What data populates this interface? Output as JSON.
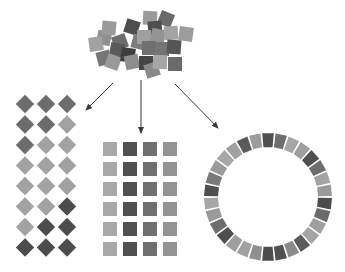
{
  "diagram": {
    "title": "",
    "palette": {
      "darkest": "#4a4a4a",
      "dark": "#5e5e5e",
      "mid_dark": "#6f6f6f",
      "mid": "#878787",
      "light_mid": "#999999",
      "light": "#a9a9a9",
      "arrow": "#3a3a3a",
      "background": "#ffffff"
    },
    "source_cluster": {
      "label": "scattered-squares",
      "squares": [
        {
          "x": 104,
          "y": 38,
          "s": 14,
          "r": 12,
          "c": "#8f8f8f"
        },
        {
          "x": 96,
          "y": 44,
          "s": 14,
          "r": -8,
          "c": "#a2a2a2"
        },
        {
          "x": 109,
          "y": 28,
          "s": 14,
          "r": 5,
          "c": "#9a9a9a"
        },
        {
          "x": 132,
          "y": 27,
          "s": 14,
          "r": 18,
          "c": "#4e4e4e"
        },
        {
          "x": 120,
          "y": 42,
          "s": 14,
          "r": -20,
          "c": "#6d6d6d"
        },
        {
          "x": 117,
          "y": 50,
          "s": 14,
          "r": 10,
          "c": "#5a5a5a"
        },
        {
          "x": 104,
          "y": 58,
          "s": 14,
          "r": -15,
          "c": "#767676"
        },
        {
          "x": 113,
          "y": 62,
          "s": 14,
          "r": 20,
          "c": "#999999"
        },
        {
          "x": 128,
          "y": 55,
          "s": 14,
          "r": 8,
          "c": "#3e3e3e"
        },
        {
          "x": 132,
          "y": 62,
          "s": 14,
          "r": -12,
          "c": "#8e8e8e"
        },
        {
          "x": 139,
          "y": 42,
          "s": 14,
          "r": 15,
          "c": "#7c7c7c"
        },
        {
          "x": 150,
          "y": 18,
          "s": 14,
          "r": 3,
          "c": "#9b9b9b"
        },
        {
          "x": 166,
          "y": 19,
          "s": 14,
          "r": 22,
          "c": "#6a6a6a"
        },
        {
          "x": 155,
          "y": 28,
          "s": 14,
          "r": -5,
          "c": "#4f4f4f"
        },
        {
          "x": 144,
          "y": 37,
          "s": 14,
          "r": 0,
          "c": "#a0a0a0"
        },
        {
          "x": 158,
          "y": 36,
          "s": 14,
          "r": 12,
          "c": "#939393"
        },
        {
          "x": 171,
          "y": 33,
          "s": 14,
          "r": -3,
          "c": "#a4a4a4"
        },
        {
          "x": 186,
          "y": 34,
          "s": 14,
          "r": 8,
          "c": "#9c9c9c"
        },
        {
          "x": 149,
          "y": 48,
          "s": 14,
          "r": 0,
          "c": "#707070"
        },
        {
          "x": 162,
          "y": 49,
          "s": 14,
          "r": 0,
          "c": "#757575"
        },
        {
          "x": 174,
          "y": 47,
          "s": 14,
          "r": 4,
          "c": "#555555"
        },
        {
          "x": 146,
          "y": 63,
          "s": 14,
          "r": 0,
          "c": "#454545"
        },
        {
          "x": 152,
          "y": 70,
          "s": 14,
          "r": -18,
          "c": "#8a8a8a"
        },
        {
          "x": 160,
          "y": 62,
          "s": 14,
          "r": 2,
          "c": "#a6a6a6"
        },
        {
          "x": 175,
          "y": 64,
          "s": 14,
          "r": 0,
          "c": "#6a6a6a"
        }
      ]
    },
    "arrows": [
      {
        "name": "arrow-to-diamond-lattice",
        "x1": 113,
        "y1": 83,
        "x2": 86,
        "y2": 110
      },
      {
        "name": "arrow-to-square-grid",
        "x1": 141,
        "y1": 80,
        "x2": 141,
        "y2": 133
      },
      {
        "name": "arrow-to-ring",
        "x1": 175,
        "y1": 84,
        "x2": 218,
        "y2": 128
      }
    ],
    "diamond_lattice": {
      "label": "diamond-lattice",
      "columns": 3,
      "rows": 8,
      "origin_x": 25,
      "origin_y": 104,
      "step_x": 21,
      "step_y": 20.5,
      "size": 13,
      "colors": [
        [
          "#6c6c6c",
          "#6c6c6c",
          "#6c6c6c"
        ],
        [
          "#6c6c6c",
          "#6c6c6c",
          "#a2a2a2"
        ],
        [
          "#6c6c6c",
          "#a2a2a2",
          "#a2a2a2"
        ],
        [
          "#a2a2a2",
          "#a2a2a2",
          "#a2a2a2"
        ],
        [
          "#a2a2a2",
          "#a2a2a2",
          "#a2a2a2"
        ],
        [
          "#a2a2a2",
          "#a2a2a2",
          "#4c4c4c"
        ],
        [
          "#a2a2a2",
          "#4c4c4c",
          "#4c4c4c"
        ],
        [
          "#4c4c4c",
          "#4c4c4c",
          "#4c4c4c"
        ]
      ]
    },
    "square_grid": {
      "label": "square-grid",
      "columns": 4,
      "rows": 6,
      "origin_x": 103,
      "origin_y": 142,
      "step_x": 20,
      "step_y": 20,
      "size": 14,
      "column_colors": [
        "#a8a8a8",
        "#505050",
        "#6f6f6f",
        "#939393"
      ]
    },
    "ring": {
      "label": "ring-arrangement",
      "center_x": 268,
      "center_y": 197,
      "outer_radius": 64,
      "inner_radius": 50,
      "segments": 30,
      "start_angle_deg": -90,
      "colors": [
        "#505050",
        "#6e6e6e",
        "#a6a6a6",
        "#9e9e9e",
        "#4f4f4f",
        "#6e6e6e",
        "#a4a4a4",
        "#9a9a9a",
        "#4c4c4c",
        "#6a6a6a",
        "#9f9f9f",
        "#a4a4a4",
        "#5c5c5c",
        "#8a8a8a",
        "#505050",
        "#4c4c4c",
        "#8f8f8f",
        "#a0a0a0",
        "#9e9e9e",
        "#4e4e4e",
        "#6d6d6d",
        "#9a9a9a",
        "#a7a7a7",
        "#4e4e4e",
        "#7a7a7a",
        "#9a9a9a",
        "#a7a7a7",
        "#a0a0a0",
        "#5a5a5a",
        "#9c9c9c"
      ]
    }
  }
}
